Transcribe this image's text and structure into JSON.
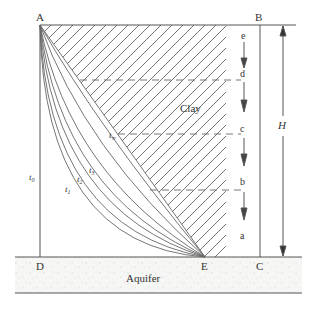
{
  "diagram": {
    "points": {
      "A": "A",
      "B": "B",
      "C": "C",
      "D": "D",
      "E": "E"
    },
    "regions": {
      "clay": "Clay",
      "aquifer": "Aquifer"
    },
    "levels": [
      "e",
      "d",
      "c",
      "b",
      "a"
    ],
    "dimension": "H",
    "curves": {
      "t0": {
        "base": "t",
        "sub": "0"
      },
      "t1": {
        "base": "t",
        "sub": "1"
      },
      "t2": {
        "base": "t",
        "sub": "2"
      },
      "t3": {
        "base": "t",
        "sub": "3"
      },
      "tinf": {
        "base": "t",
        "sub": "∞"
      }
    },
    "colors": {
      "line": "#555555",
      "hatch": "#666666",
      "aquifer_fill": "#f4f4f2"
    }
  }
}
